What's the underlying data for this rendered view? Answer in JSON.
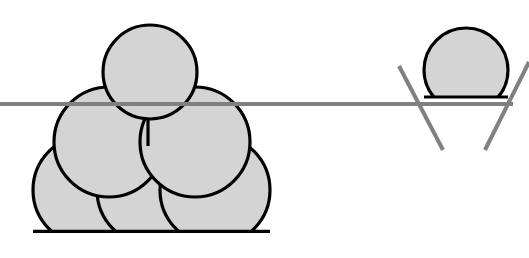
{
  "figure": {
    "canvas": {
      "width": 529,
      "height": 258,
      "background": "#ffffff"
    },
    "style": {
      "circle_fill": "#D4D4D4",
      "circle_stroke": "#000000",
      "circle_stroke_width": 3.2,
      "guide_line_color": "#808080",
      "guide_line_width": 4,
      "cut_line_color": "#808080",
      "cut_line_width": 4
    },
    "left_group": {
      "name": "circle-stack",
      "description": "Pyramid stack of six circles, flat-clipped at the baseline",
      "baseline_y": 233,
      "circles": [
        {
          "id": "bottom-left",
          "label": "Bottom left circle",
          "cx": 88,
          "cy": 190,
          "r": 55
        },
        {
          "id": "bottom-middle",
          "label": "Bottom middle circle",
          "cx": 152,
          "cy": 190,
          "r": 55
        },
        {
          "id": "bottom-right",
          "label": "Bottom right circle",
          "cx": 215,
          "cy": 190,
          "r": 55
        },
        {
          "id": "middle-left",
          "label": "Middle left circle",
          "cx": 109,
          "cy": 142,
          "r": 55
        },
        {
          "id": "middle-right",
          "label": "Middle right circle",
          "cx": 195,
          "cy": 142,
          "r": 55
        },
        {
          "id": "top",
          "label": "Top circle",
          "cx": 150,
          "cy": 72,
          "r": 47
        }
      ],
      "contact_tick": {
        "id": "contact-tick",
        "x": 148,
        "y1": 120,
        "y2": 146
      }
    },
    "horizontal_line": {
      "name": "secant-line",
      "label": "Horizontal secant line",
      "x1": 0,
      "y1": 104,
      "x2": 513,
      "y2": 104
    },
    "right_group": {
      "name": "dome-with-crossing-lines",
      "description": "Circle clipped by the horizontal line forming a dome, with two crossing diagonals",
      "dome": {
        "id": "dome",
        "label": "Dome (clipped circle)",
        "cx": 466,
        "cy": 70,
        "r": 42,
        "clip_y": 97
      },
      "diagonals": [
        {
          "id": "diagonal-left",
          "label": "Left crossing line",
          "x1": 399,
          "y1": 66,
          "x2": 443,
          "y2": 150
        },
        {
          "id": "diagonal-right",
          "label": "Right crossing line",
          "x1": 485,
          "y1": 150,
          "x2": 529,
          "y2": 62
        }
      ]
    }
  }
}
